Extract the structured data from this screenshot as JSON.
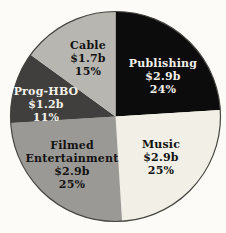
{
  "chart_data": {
    "type": "pie",
    "start": "top",
    "direction": "clockwise",
    "background_color": "#fcfbf7",
    "outline_color": "#45443e",
    "segments": [
      {
        "name": "Publishing",
        "value": "$2.9b",
        "pct": "24%",
        "percent": 24,
        "color": "#0c0c0c",
        "text_color": "#f2f1ea"
      },
      {
        "name": "Music",
        "value": "$2.9b",
        "pct": "25%",
        "percent": 25,
        "color": "#f1efe6",
        "text_color": "#121212"
      },
      {
        "name": "Filmed Entertainment",
        "value": "$2.9b",
        "pct": "25%",
        "percent": 25,
        "color": "#9b9995",
        "text_color": "#121212"
      },
      {
        "name": "Prog-HBO",
        "value": "$1.2b",
        "pct": "11%",
        "percent": 11,
        "color": "#403f3d",
        "text_color": "#f2f1ea"
      },
      {
        "name": "Cable",
        "value": "$1.7b",
        "pct": "15%",
        "percent": 15,
        "color": "#b8b6b1",
        "text_color": "#121212"
      }
    ]
  }
}
